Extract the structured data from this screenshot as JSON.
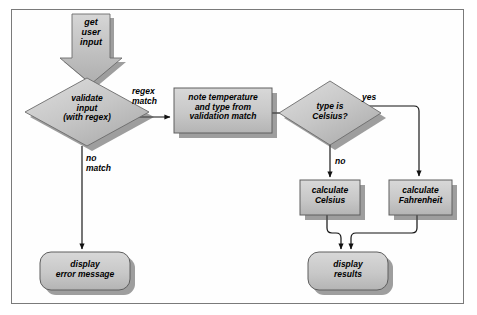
{
  "diagram": {
    "type": "flowchart",
    "frame": {
      "border_color": "#7a7a7a",
      "background": "#ffffff"
    },
    "palette": {
      "shape_fill_light": "#d2d2d2",
      "shape_fill_mid": "#bdbdbd",
      "shape_fill_dark": "#a8a8a8",
      "shape_stroke": "#555555",
      "shadow": "#4a4a4a",
      "line": "#111111",
      "text": "#000000"
    },
    "nodes": [
      {
        "id": "get-user-input",
        "shape": "block-arrow-down",
        "label": "get\nuser\ninput",
        "label_lines": [
          "get",
          "user",
          "input"
        ]
      },
      {
        "id": "validate-input",
        "shape": "diamond",
        "label": "validate\ninput\n(with regex)",
        "label_lines": [
          "validate",
          "input",
          "(with regex)"
        ]
      },
      {
        "id": "note-temperature",
        "shape": "rectangle",
        "label": "note temperature\nand type from\nvalidation match",
        "label_lines": [
          "note temperature",
          "and type from",
          "validation match"
        ]
      },
      {
        "id": "type-is-celsius",
        "shape": "diamond",
        "label": "type is\nCelsius?",
        "label_lines": [
          "type is",
          "Celsius?"
        ]
      },
      {
        "id": "calculate-celsius",
        "shape": "rectangle",
        "label": "calculate\nCelsius",
        "label_lines": [
          "calculate",
          "Celsius"
        ]
      },
      {
        "id": "calculate-fahrenheit",
        "shape": "rectangle",
        "label": "calculate\nFahrenheit",
        "label_lines": [
          "calculate",
          "Fahrenheit"
        ]
      },
      {
        "id": "display-error-message",
        "shape": "rounded-rectangle",
        "label": "display\nerror message",
        "label_lines": [
          "display",
          "error message"
        ]
      },
      {
        "id": "display-results",
        "shape": "rounded-rectangle",
        "label": "display\nresults",
        "label_lines": [
          "display",
          "results"
        ]
      }
    ],
    "edges": [
      {
        "id": "validate-to-note",
        "from": "validate-input",
        "to": "note-temperature",
        "label": "regex\nmatch",
        "label_lines": [
          "regex",
          "match"
        ]
      },
      {
        "id": "validate-to-error",
        "from": "validate-input",
        "to": "display-error-message",
        "label": "no\nmatch",
        "label_lines": [
          "no",
          "match"
        ]
      },
      {
        "id": "note-to-type",
        "from": "note-temperature",
        "to": "type-is-celsius",
        "label": ""
      },
      {
        "id": "type-to-celsius",
        "from": "type-is-celsius",
        "to": "calculate-celsius",
        "label": "no",
        "label_lines": [
          "no"
        ]
      },
      {
        "id": "type-to-fahrenheit",
        "from": "type-is-celsius",
        "to": "calculate-fahrenheit",
        "label": "yes",
        "label_lines": [
          "yes"
        ]
      },
      {
        "id": "celsius-to-results",
        "from": "calculate-celsius",
        "to": "display-results",
        "label": ""
      },
      {
        "id": "fahrenheit-to-results",
        "from": "calculate-fahrenheit",
        "to": "display-results",
        "label": ""
      },
      {
        "id": "input-to-validate",
        "from": "get-user-input",
        "to": "validate-input",
        "label": ""
      }
    ]
  }
}
